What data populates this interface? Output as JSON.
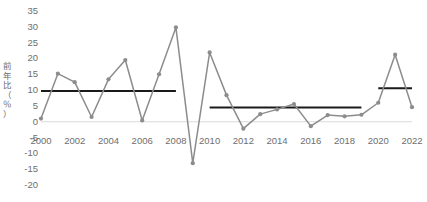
{
  "chart_data": {
    "type": "line",
    "title": "",
    "xlabel": "",
    "ylabel": "前年比（％）",
    "ylim": [
      -20,
      35
    ],
    "ytick_values": [
      35,
      30,
      25,
      20,
      15,
      10,
      5,
      0,
      -5,
      -10,
      -15,
      -20
    ],
    "ytick_labels": [
      "35",
      "30",
      "25",
      "20",
      "15",
      "10",
      "5",
      "0",
      "-5",
      "-10",
      "-15",
      "-20"
    ],
    "xtick_labels": [
      "2000",
      "2002",
      "2004",
      "2006",
      "2008",
      "2010",
      "2012",
      "2014",
      "2016",
      "2018",
      "2020",
      "2022"
    ],
    "xlim": [
      2000,
      2022
    ],
    "grid": false,
    "legend": "none",
    "x": [
      2000,
      2001,
      2002,
      2003,
      2004,
      2005,
      2006,
      2007,
      2008,
      2009,
      2010,
      2011,
      2012,
      2013,
      2014,
      2015,
      2016,
      2017,
      2018,
      2019,
      2020,
      2021,
      2022
    ],
    "series": [
      {
        "name": "前年比",
        "color": "#8c8c8c",
        "marker": "circle",
        "values": [
          1.0,
          15.2,
          12.5,
          1.5,
          13.4,
          19.5,
          0.4,
          15.0,
          29.8,
          -13.1,
          21.9,
          8.4,
          -2.2,
          2.4,
          3.9,
          5.6,
          -1.4,
          2.1,
          1.7,
          2.2,
          6.0,
          21.2,
          4.6
        ]
      }
    ],
    "average_lines": [
      {
        "name": "平均（2000-2008）",
        "value": 9.7,
        "x_start": 2000,
        "x_end": 2008,
        "color": "#1a1a1a"
      },
      {
        "name": "平均（2010-2019）",
        "value": 4.5,
        "x_start": 2010,
        "x_end": 2019,
        "color": "#1a1a1a"
      },
      {
        "name": "平均（2020-2022）",
        "value": 10.6,
        "x_start": 2020,
        "x_end": 2022,
        "color": "#1a1a1a"
      }
    ],
    "zero_line": {
      "value": 0,
      "color": "#d9d9d9"
    }
  },
  "axis": {
    "y_title_chars": [
      "前",
      "年",
      "比",
      "（",
      "％",
      "）"
    ]
  }
}
